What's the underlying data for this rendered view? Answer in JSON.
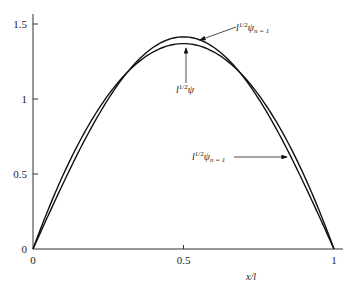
{
  "chart_data": {
    "type": "line",
    "title": "",
    "xlabel": "x/l",
    "ylabel": "",
    "xlim": [
      0,
      1
    ],
    "ylim": [
      0,
      1.55
    ],
    "grid": false,
    "legend": "none (curves labeled with arrow annotations)",
    "x_ticks": [
      {
        "value": 0,
        "label": "0"
      },
      {
        "value": 0.5,
        "label": "0.5"
      },
      {
        "value": 1,
        "label": "1"
      }
    ],
    "y_ticks": [
      {
        "value": 0,
        "label": "0"
      },
      {
        "value": 0.5,
        "label": "0.5"
      },
      {
        "value": 1,
        "label": "1"
      },
      {
        "value": 1.5,
        "label": "1.5"
      }
    ],
    "x": [
      0,
      0.1,
      0.2,
      0.3,
      0.4,
      0.5,
      0.6,
      0.7,
      0.8,
      0.9,
      1.0
    ],
    "series": [
      {
        "name": "l^{1/2} ψ_{n=1}",
        "description": "exact ground-state wavefunction, sqrt(2)·sin(πx/l)",
        "values": [
          0,
          0.437,
          0.831,
          1.144,
          1.345,
          1.414,
          1.345,
          1.144,
          0.831,
          0.437,
          0
        ]
      },
      {
        "name": "l^{1/2} ψ",
        "description": "trial (variational) function, sqrt(30)·(x/l)(1−x/l)",
        "values": [
          0,
          0.493,
          0.876,
          1.15,
          1.314,
          1.369,
          1.314,
          1.15,
          0.876,
          0.493,
          0
        ]
      }
    ],
    "annotations": [
      {
        "text_base": "l",
        "sup": "1/2",
        "psi": "ψ",
        "sub": "n = 1",
        "target": "peak of upper curve",
        "x": 0.52,
        "y": 1.41
      },
      {
        "text_base": "l",
        "sup": "1/2",
        "psi": "ψ",
        "sub": "",
        "target": "peak of lower curve (arrow pointing up)",
        "x": 0.5,
        "y": 1.37
      },
      {
        "text_base": "l",
        "sup": "1/2",
        "psi": "ψ",
        "sub": "n = 1",
        "target": "right descending branch",
        "x": 0.87,
        "y": 0.62
      }
    ]
  },
  "labels": {
    "x_axis": "x/l",
    "ann1": {
      "base": "l",
      "sup": "1/2",
      "psi": "ψ",
      "sub": "n = 1"
    },
    "ann2": {
      "base": "l",
      "sup": "1/2",
      "psi": "ψ",
      "sub": ""
    },
    "ann3": {
      "base": "l",
      "sup": "1/2",
      "psi": "ψ",
      "sub": "n = 1"
    }
  }
}
